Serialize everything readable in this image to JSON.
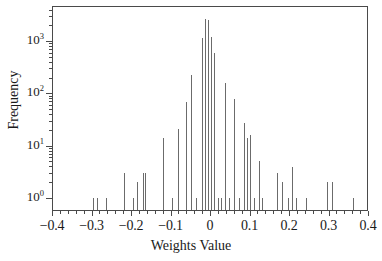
{
  "chart_data": {
    "type": "bar",
    "title": "",
    "subtitle": "",
    "xlabel": "Weights Value",
    "ylabel": "Frequency",
    "xlim": [
      -0.4,
      0.4
    ],
    "ylim": [
      0.7,
      4000
    ],
    "yscale": "log",
    "xscale": "linear",
    "grid": false,
    "legend": null,
    "legend_position": "none",
    "xtick_labels": [
      "-0.4",
      "-0.3",
      "-0.2",
      "-0.1",
      "0",
      "0.1",
      "0.2",
      "0.3",
      "0.4"
    ],
    "xtick_values": [
      -0.4,
      -0.3,
      -0.2,
      -0.1,
      0,
      0.1,
      0.2,
      0.3,
      0.4
    ],
    "ytick_labels": [
      "10^0",
      "10^1",
      "10^2",
      "10^3"
    ],
    "ytick_mantissa": [
      "10",
      "10",
      "10",
      "10"
    ],
    "ytick_exponent": [
      "0",
      "1",
      "2",
      "3"
    ],
    "ytick_values": [
      1,
      10,
      100,
      1000
    ],
    "bar_color": "#6b6b6b",
    "axis_color": "#4a4a4a",
    "background_color": "#ffffff",
    "x": [
      -0.298,
      -0.288,
      -0.265,
      -0.22,
      -0.197,
      -0.186,
      -0.172,
      -0.165,
      -0.121,
      -0.097,
      -0.082,
      -0.062,
      -0.05,
      -0.036,
      -0.022,
      -0.013,
      -0.006,
      0.001,
      0.009,
      0.018,
      0.026,
      0.036,
      0.048,
      0.06,
      0.072,
      0.084,
      0.092,
      0.101,
      0.111,
      0.122,
      0.131,
      0.168,
      0.18,
      0.196,
      0.207,
      0.216,
      0.243,
      0.296,
      0.307,
      0.36
    ],
    "values": [
      1,
      1,
      1,
      3,
      1,
      2,
      3,
      3,
      14,
      1,
      21,
      68,
      220,
      1,
      1150,
      2600,
      2500,
      1200,
      600,
      1,
      1,
      155,
      1,
      78,
      1,
      27,
      14,
      16,
      1,
      5,
      1,
      3,
      2,
      1,
      4,
      1,
      1,
      2,
      2,
      1
    ]
  }
}
